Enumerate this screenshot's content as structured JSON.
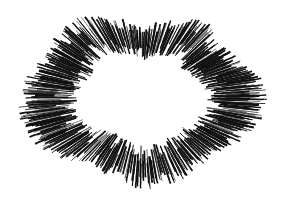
{
  "artwork": {
    "title": "Radial Ink Burst",
    "subject": "abstract starburst / explosion ring",
    "style": "hand-drawn jagged ink zigzag strokes",
    "canvas": {
      "width": 285,
      "height": 200,
      "background_color": "#ffffff"
    },
    "ink_color": "#111111",
    "center": {
      "x": 142,
      "y": 98
    },
    "hollow_center": true,
    "silhouette": "lobed butterfly-like blob with concave notches at top-center, bottom-center, upper-right and left",
    "extents": {
      "left": 20,
      "right": 270,
      "top": 12,
      "bottom": 186
    },
    "ray_count": 560,
    "zigzag_segments_per_ray": 9,
    "stroke_width_range": [
      0.5,
      1.9
    ],
    "inner_radius_fraction": 0.52,
    "outer_radius_fraction": 1.0,
    "jitter_amount": 0.17,
    "seed": 20240917,
    "lobe_profile": {
      "description": "outer radius multiplier sampled at 24 equally spaced angles starting at 0 deg (pointing right), going clockwise in screen coords",
      "angles_deg": [
        0,
        15,
        30,
        45,
        60,
        75,
        90,
        105,
        120,
        135,
        150,
        165,
        180,
        195,
        210,
        225,
        240,
        255,
        270,
        285,
        300,
        315,
        330,
        345
      ],
      "radius_multipliers": [
        1.0,
        0.98,
        0.93,
        0.86,
        0.9,
        0.99,
        1.02,
        0.92,
        0.84,
        0.93,
        1.0,
        1.0,
        0.98,
        0.96,
        0.9,
        0.97,
        1.04,
        0.93,
        0.8,
        0.9,
        1.0,
        0.86,
        0.88,
        0.97
      ]
    },
    "base_radius": {
      "x": 126,
      "y": 90
    }
  }
}
